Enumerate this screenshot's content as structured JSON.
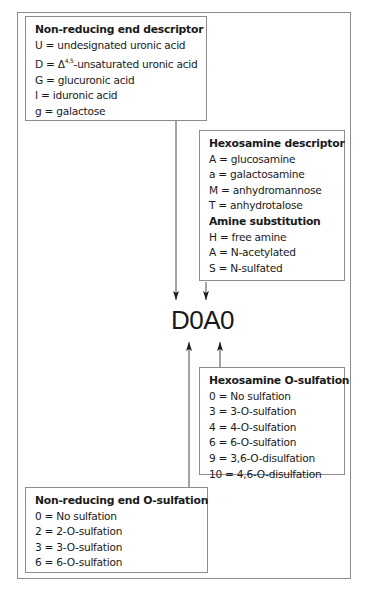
{
  "diagram": {
    "code_label": "D0A0",
    "boxes": {
      "non_reducing_end_descriptor": {
        "title": "Non-reducing end descriptor",
        "items": [
          "U = undesignated uronic acid",
          "D = Δ4,5-unsaturated uronic acid",
          "G = glucuronic acid",
          "I = iduronic acid",
          "g = galactose"
        ],
        "d_prefix": "D = Δ",
        "d_sup": "4,5",
        "d_suffix": "-unsaturated uronic acid"
      },
      "hexosamine_descriptor": {
        "title": "Hexosamine descriptor",
        "items": [
          "A = glucosamine",
          "a = galactosamine",
          "M = anhydromannose",
          "T = anhydrotalose"
        ],
        "subtitle": "Amine substitution",
        "sub_items": [
          "H = free amine",
          "A = N-acetylated",
          "S = N-sulfated"
        ]
      },
      "hexosamine_o_sulfation": {
        "title": "Hexosamine O-sulfation",
        "items": [
          "0 = No sulfation",
          "3 = 3-O-sulfation",
          "4 = 4-O-sulfation",
          "6 = 6-O-sulfation",
          "9 = 3,6-O-disulfation",
          "10 = 4,6-O-disulfation"
        ]
      },
      "non_reducing_end_o_sulfation": {
        "title": "Non-reducing end O-sulfation",
        "items": [
          "0 = No sulfation",
          "2 = 2-O-sulfation",
          "3 = 3-O-sulfation",
          "6 = 6-O-sulfation"
        ]
      }
    },
    "colors": {
      "border": "#8c8c8c",
      "text": "#1a1a1a",
      "arrow": "#1a1a1a",
      "background": "#ffffff"
    }
  }
}
